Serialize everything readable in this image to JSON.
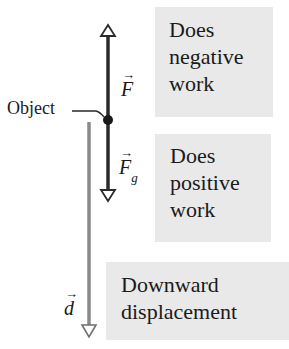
{
  "diagram": {
    "title": "",
    "labels": {
      "object": "Object",
      "force_applied": "F",
      "force_gravity": "F",
      "force_gravity_subscript": "g",
      "displacement": "d",
      "vector_arrow": "→"
    },
    "boxes": [
      {
        "lines": [
          "Does",
          "negative",
          "work"
        ]
      },
      {
        "lines": [
          "Does",
          "positive",
          "work"
        ]
      },
      {
        "lines": [
          "Downward",
          "displacement"
        ]
      }
    ],
    "colors": {
      "force_line": "#2a2a2a",
      "displacement_line": "#8a8a8a",
      "box_fill": "#e9e9e9",
      "text": "#1a1a1a"
    },
    "arrows": [
      {
        "name": "applied-force",
        "direction": "up",
        "from": [
          108,
          120
        ],
        "to": [
          108,
          25
        ]
      },
      {
        "name": "gravitational-force",
        "direction": "down",
        "from": [
          108,
          120
        ],
        "to": [
          108,
          200
        ]
      },
      {
        "name": "displacement",
        "direction": "down",
        "from": [
          89,
          122
        ],
        "to": [
          89,
          337
        ]
      }
    ]
  }
}
